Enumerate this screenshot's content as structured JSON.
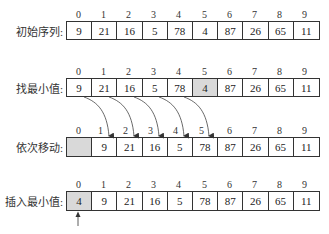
{
  "indices": [
    "0",
    "1",
    "2",
    "3",
    "4",
    "5",
    "6",
    "7",
    "8",
    "9"
  ],
  "rows": [
    {
      "label": "初始序列:",
      "cells": [
        "9",
        "21",
        "16",
        "5",
        "78",
        "4",
        "87",
        "26",
        "65",
        "11"
      ],
      "highlight": []
    },
    {
      "label": "找最小值:",
      "cells": [
        "9",
        "21",
        "16",
        "5",
        "78",
        "4",
        "87",
        "26",
        "65",
        "11"
      ],
      "highlight": [
        5
      ]
    },
    {
      "label": "依次移动:",
      "cells": [
        "",
        "9",
        "21",
        "16",
        "5",
        "78",
        "87",
        "26",
        "65",
        "11"
      ],
      "highlight": [
        0
      ]
    },
    {
      "label": "插入最小值:",
      "cells": [
        "4",
        "9",
        "21",
        "16",
        "5",
        "78",
        "87",
        "26",
        "65",
        "11"
      ],
      "highlight": [
        0
      ]
    }
  ],
  "colors": {
    "border": "#333333",
    "highlight": "#d9d9d9",
    "text": "#222222"
  }
}
